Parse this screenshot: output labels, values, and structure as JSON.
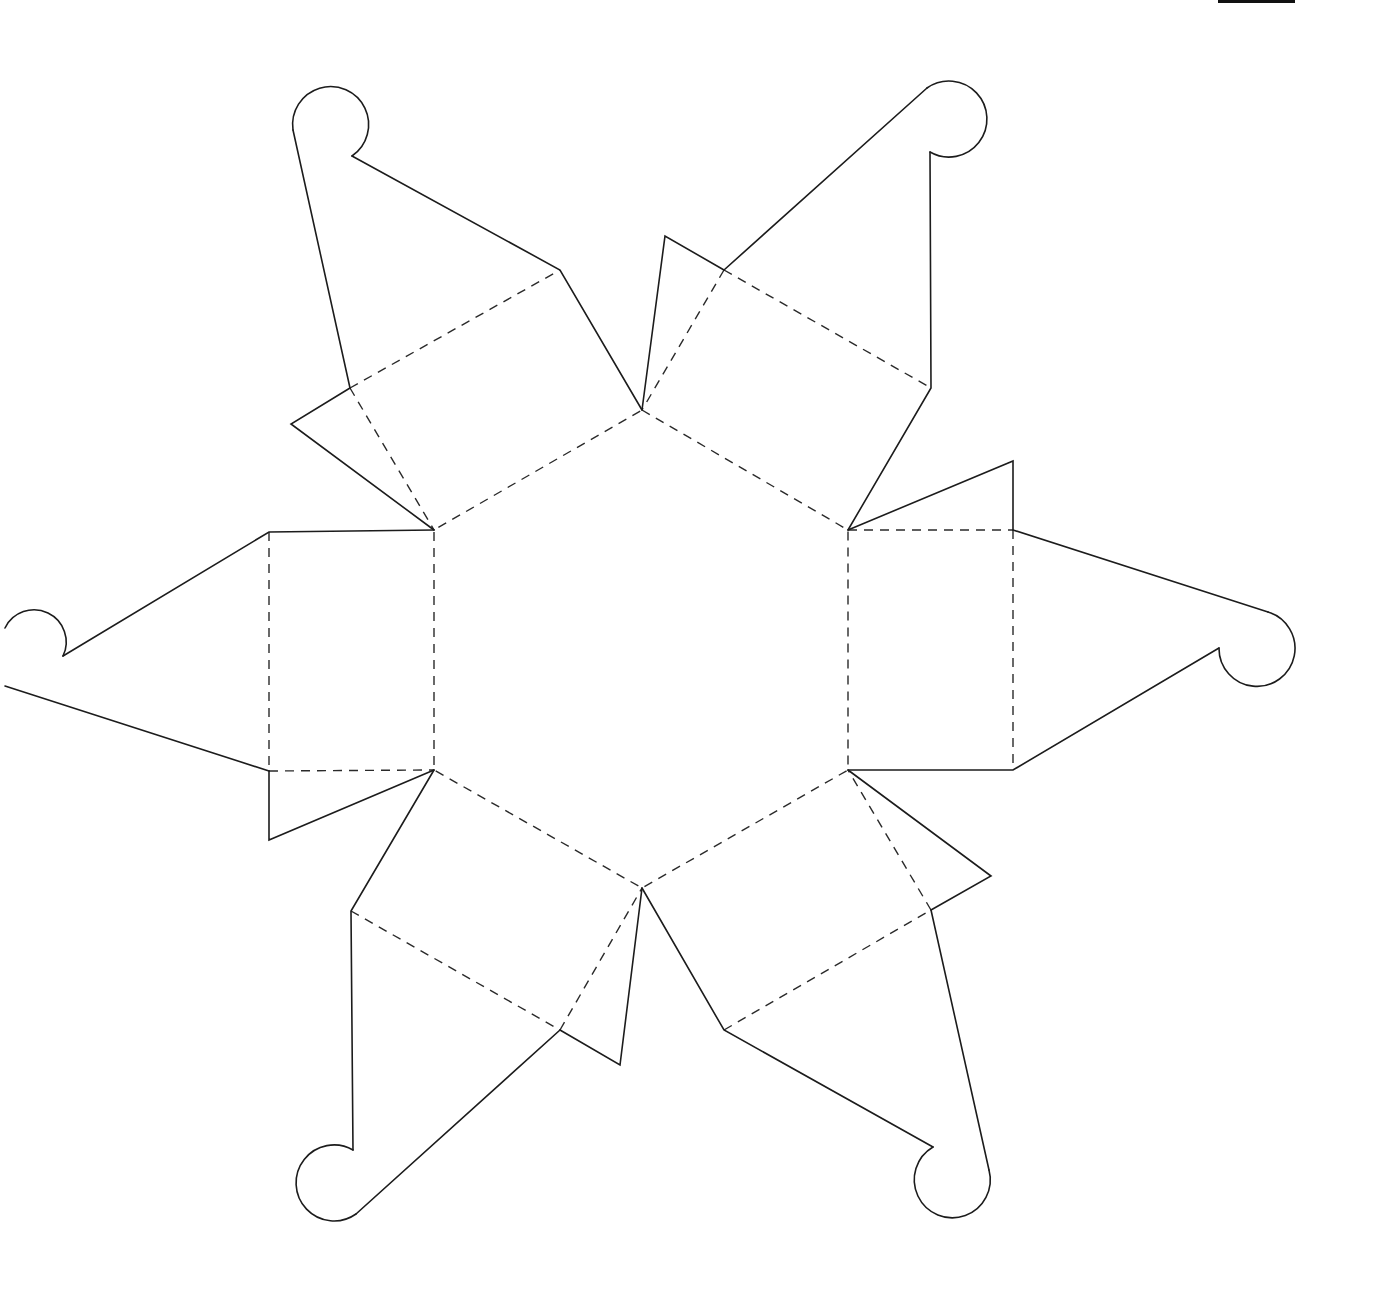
{
  "diagram": {
    "type": "papercraft-template",
    "colors": {
      "background": "#ffffff",
      "cut_line": "#1c1c1c",
      "fold_line": "#2a2a2a",
      "top_bar": "#111111"
    },
    "legend": {
      "cut_line_style": "solid",
      "fold_line_style": "dashed"
    },
    "center_hexagon": {
      "vertices": [
        [
          642,
          410
        ],
        [
          848,
          530
        ],
        [
          848,
          770
        ],
        [
          642,
          888
        ],
        [
          434,
          770
        ],
        [
          434,
          530
        ]
      ]
    },
    "arms": [
      {
        "id": "top-left",
        "direction": "upper-left",
        "hook_center": [
          330,
          120
        ]
      },
      {
        "id": "top-right",
        "direction": "upper-right",
        "hook_center": [
          952,
          118
        ]
      },
      {
        "id": "left",
        "direction": "left",
        "hook_center": [
          22,
          648
        ]
      },
      {
        "id": "right",
        "direction": "right",
        "hook_center": [
          1258,
          648
        ]
      },
      {
        "id": "bottom-left",
        "direction": "lower-left",
        "hook_center": [
          330,
          1182
        ]
      },
      {
        "id": "bottom-right",
        "direction": "lower-right",
        "hook_center": [
          952,
          1182
        ]
      }
    ],
    "arm_count": 6,
    "glue_tab_count": 6
  }
}
